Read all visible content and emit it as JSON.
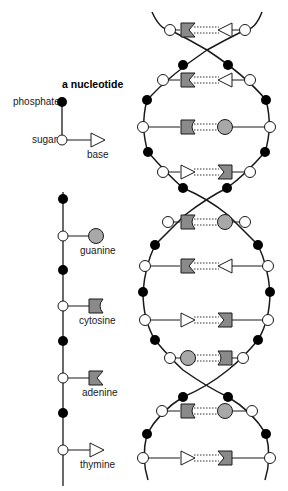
{
  "legend": {
    "title": "a nucleotide",
    "phosphate_label": "phosphate",
    "sugar_label": "sugar",
    "base_label": "base"
  },
  "bases": [
    {
      "name": "guanine",
      "shape": "circle"
    },
    {
      "name": "cytosine",
      "shape": "notched-square"
    },
    {
      "name": "adenine",
      "shape": "v-notch-square"
    },
    {
      "name": "thymine",
      "shape": "triangle"
    }
  ],
  "colors": {
    "stroke": "#1a1a1a",
    "phosphate_fill": "#000000",
    "sugar_fill": "#ffffff",
    "base_gray": "#8a8a8a",
    "guanine_gray": "#a8a8a8"
  },
  "helix_pairs": [
    {
      "y": 30,
      "lx": 170,
      "rx": 245,
      "left": "adenine",
      "right": "thymine"
    },
    {
      "y": 80,
      "lx": 163,
      "rx": 250,
      "left": "adenine",
      "right": "thymine"
    },
    {
      "y": 127,
      "lx": 143,
      "rx": 270,
      "left": "cytosine",
      "right": "guanine"
    },
    {
      "y": 172,
      "lx": 163,
      "rx": 250,
      "left": "thymine",
      "right": "adenine"
    },
    {
      "y": 222,
      "lx": 168,
      "rx": 245,
      "left": "cytosine",
      "right": "guanine"
    },
    {
      "y": 266,
      "lx": 145,
      "rx": 268,
      "left": "adenine",
      "right": "thymine"
    },
    {
      "y": 320,
      "lx": 145,
      "rx": 268,
      "left": "thymine",
      "right": "adenine"
    },
    {
      "y": 358,
      "lx": 170,
      "rx": 243,
      "left": "guanine",
      "right": "cytosine"
    },
    {
      "y": 411,
      "lx": 162,
      "rx": 252,
      "left": "cytosine",
      "right": "guanine"
    },
    {
      "y": 458,
      "lx": 143,
      "rx": 270,
      "left": "thymine",
      "right": "adenine"
    }
  ]
}
